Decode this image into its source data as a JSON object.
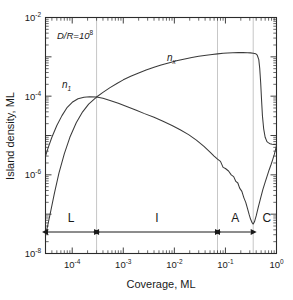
{
  "chart_data": {
    "type": "line",
    "title": "",
    "xlabel": "Coverage,  ML",
    "ylabel": "Island density, ML",
    "xscale": "log",
    "yscale": "log",
    "xlim": [
      3e-05,
      1.0
    ],
    "ylim": [
      1e-08,
      0.01
    ],
    "grid": "vertical-region-dividers-only",
    "legend": "inline-curve-labels",
    "annotations": [
      {
        "name": "parameter-annotation",
        "text": "D/R=10",
        "exponent": "8"
      },
      {
        "name": "curve-label-n1",
        "text": "n",
        "subscript": "1"
      },
      {
        "name": "curve-label-nx",
        "text": "n",
        "subscript": "x"
      }
    ],
    "region_dividers": [
      0.0003,
      0.07,
      0.35
    ],
    "regions": [
      {
        "label": "L",
        "from": 3e-05,
        "to": 0.0003
      },
      {
        "label": "I",
        "from": 0.0003,
        "to": 0.07
      },
      {
        "label": "A",
        "from": 0.07,
        "to": 0.35
      },
      {
        "label": "C",
        "from": 0.35,
        "to": 1.0
      }
    ],
    "xticks": [
      {
        "value": 0.0001,
        "mantissa": "10",
        "exponent": "-4"
      },
      {
        "value": 0.001,
        "mantissa": "10",
        "exponent": "-3"
      },
      {
        "value": 0.01,
        "mantissa": "10",
        "exponent": "-2"
      },
      {
        "value": 0.1,
        "mantissa": "10",
        "exponent": "-1"
      },
      {
        "value": 1.0,
        "mantissa": "10",
        "exponent": "0"
      }
    ],
    "yticks": [
      {
        "value": 0.01,
        "mantissa": "10",
        "exponent": "-2"
      },
      {
        "value": 0.0001,
        "mantissa": "10",
        "exponent": "-4"
      },
      {
        "value": 1e-06,
        "mantissa": "10",
        "exponent": "-6"
      },
      {
        "value": 1e-08,
        "mantissa": "10",
        "exponent": "-8"
      }
    ],
    "series": [
      {
        "name": "n1",
        "label": "n1",
        "color": "#3a3a3a",
        "points": [
          [
            3e-05,
            3e-06
          ],
          [
            3.4e-05,
            5e-06
          ],
          [
            4e-05,
            9e-06
          ],
          [
            5e-05,
            1.8e-05
          ],
          [
            6.3e-05,
            3.2e-05
          ],
          [
            8e-05,
            5.2e-05
          ],
          [
            0.0001,
            7e-05
          ],
          [
            0.00013,
            8.6e-05
          ],
          [
            0.00017,
            9.4e-05
          ],
          [
            0.00022,
            9.7e-05
          ],
          [
            0.0003,
            9.5e-05
          ],
          [
            0.0004,
            8.8e-05
          ],
          [
            0.00055,
            7.8e-05
          ],
          [
            0.0008,
            6.6e-05
          ],
          [
            0.0012,
            5.4e-05
          ],
          [
            0.0018,
            4.4e-05
          ],
          [
            0.0026,
            3.6e-05
          ],
          [
            0.004,
            2.9e-05
          ],
          [
            0.006,
            2.3e-05
          ],
          [
            0.009,
            1.8e-05
          ],
          [
            0.013,
            1.4e-05
          ],
          [
            0.019,
            1.05e-05
          ],
          [
            0.027,
            7.6e-06
          ],
          [
            0.038,
            5.3e-06
          ],
          [
            0.05,
            3.8e-06
          ],
          [
            0.06,
            3e-06
          ],
          [
            0.07,
            2.5e-06
          ],
          [
            0.08,
            2.2e-06
          ],
          [
            0.09,
            1.55e-06
          ],
          [
            0.1,
            1.45e-06
          ],
          [
            0.115,
            1.25e-06
          ],
          [
            0.13,
            1e-06
          ],
          [
            0.145,
            9e-07
          ],
          [
            0.16,
            6.8e-07
          ],
          [
            0.175,
            6.2e-07
          ],
          [
            0.19,
            4.6e-07
          ],
          [
            0.21,
            3.8e-07
          ],
          [
            0.23,
            2.6e-07
          ],
          [
            0.25,
            2e-07
          ],
          [
            0.27,
            1.4e-07
          ],
          [
            0.29,
            1e-07
          ],
          [
            0.31,
            7.5e-08
          ],
          [
            0.33,
            6.2e-08
          ],
          [
            0.35,
            5.6e-08
          ],
          [
            0.37,
            6.4e-08
          ],
          [
            0.4,
            9e-08
          ],
          [
            0.44,
            1.5e-07
          ],
          [
            0.49,
            2.6e-07
          ],
          [
            0.54,
            4.2e-07
          ],
          [
            0.6,
            6.5e-07
          ],
          [
            0.66,
            9.5e-07
          ],
          [
            0.72,
            1.35e-06
          ],
          [
            0.78,
            1.8e-06
          ],
          [
            0.84,
            2.4e-06
          ],
          [
            0.9,
            3.2e-06
          ],
          [
            0.95,
            4.2e-06
          ],
          [
            1.0,
            5.6e-06
          ]
        ]
      },
      {
        "name": "nx",
        "label": "nx",
        "color": "#3a3a3a",
        "points": [
          [
            3e-05,
            3e-08
          ],
          [
            3.3e-05,
            5e-08
          ],
          [
            3.8e-05,
            1.2e-07
          ],
          [
            4.5e-05,
            3.5e-07
          ],
          [
            5.5e-05,
            1.1e-06
          ],
          [
            7e-05,
            3.4e-06
          ],
          [
            9e-05,
            9e-06
          ],
          [
            0.00012,
            2.1e-05
          ],
          [
            0.00016,
            4e-05
          ],
          [
            0.00021,
            6.3e-05
          ],
          [
            0.00027,
            8.4e-05
          ],
          [
            0.0003,
            9.5e-05
          ],
          [
            0.0004,
            0.000125
          ],
          [
            0.00055,
            0.000165
          ],
          [
            0.00075,
            0.00021
          ],
          [
            0.001,
            0.00026
          ],
          [
            0.0014,
            0.00032
          ],
          [
            0.002,
            0.00039
          ],
          [
            0.0028,
            0.00046
          ],
          [
            0.004,
            0.00054
          ],
          [
            0.0055,
            0.00062
          ],
          [
            0.008,
            0.00071
          ],
          [
            0.011,
            0.00079
          ],
          [
            0.016,
            0.00088
          ],
          [
            0.022,
            0.00096
          ],
          [
            0.03,
            0.00103
          ],
          [
            0.042,
            0.0011
          ],
          [
            0.055,
            0.00115
          ],
          [
            0.07,
            0.00119
          ],
          [
            0.09,
            0.00123
          ],
          [
            0.11,
            0.00125
          ],
          [
            0.14,
            0.00127
          ],
          [
            0.18,
            0.00128
          ],
          [
            0.22,
            0.00128
          ],
          [
            0.27,
            0.00127
          ],
          [
            0.31,
            0.00126
          ],
          [
            0.35,
            0.00124
          ],
          [
            0.39,
            0.0012
          ],
          [
            0.42,
            0.0011
          ],
          [
            0.45,
            0.00085
          ],
          [
            0.47,
            0.0005
          ],
          [
            0.49,
            0.00022
          ],
          [
            0.51,
            8e-05
          ],
          [
            0.53,
            3.2e-05
          ],
          [
            0.56,
            1.5e-05
          ],
          [
            0.6,
            9e-06
          ],
          [
            0.65,
            7e-06
          ],
          [
            0.7,
            6.5e-06
          ],
          [
            0.75,
            6.2e-06
          ],
          [
            0.82,
            6e-06
          ],
          [
            0.9,
            5.9e-06
          ],
          [
            1.0,
            5.8e-06
          ]
        ]
      }
    ]
  }
}
